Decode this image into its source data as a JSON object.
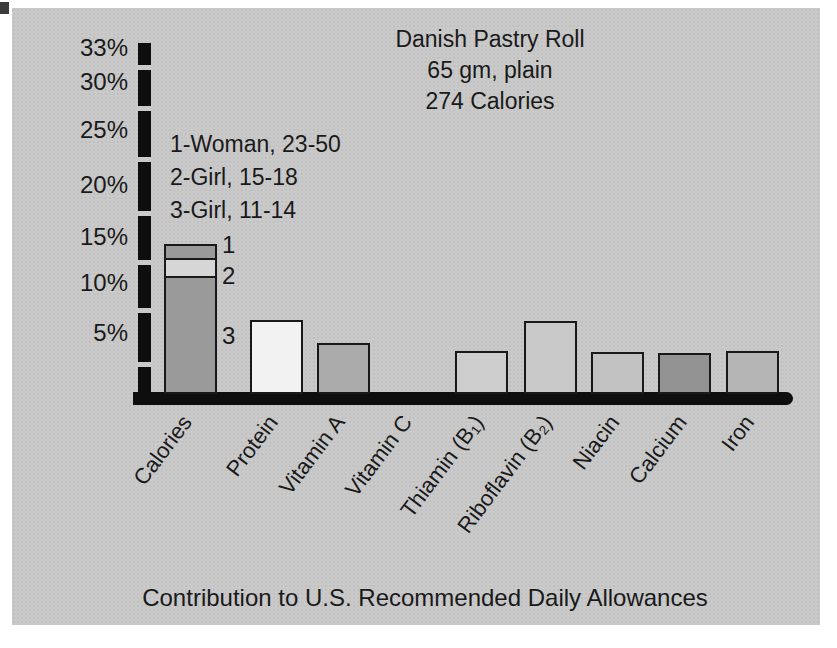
{
  "chart_data": {
    "type": "bar",
    "title_lines": [
      "Danish Pastry Roll",
      "65 gm, plain",
      "274 Calories"
    ],
    "legend": [
      "1-Woman, 23-50",
      "2-Girl, 15-18",
      "3-Girl, 11-14"
    ],
    "caption": "Contribution to U.S. Recommended Daily Allowances",
    "y_tick_labels": [
      "33%",
      "30%",
      "25%",
      "20%",
      "15%",
      "10%",
      "5%"
    ],
    "ylim": [
      0,
      33
    ],
    "grid": false,
    "legend_position": "upper-left",
    "categories": [
      "Calories",
      "Protein",
      "Vitamin A",
      "Vitamin C",
      "Thiamin (B₁)",
      "Riboflavin (B₂)",
      "Niacin",
      "Calcium",
      "Iron"
    ],
    "bars": [
      {
        "category": "Calories",
        "stacked_marks": [
          {
            "label": "1",
            "person": "Woman, 23-50",
            "value": 14.0,
            "color": "#9a9a9a"
          },
          {
            "label": "2",
            "person": "Girl, 15-18",
            "value": 12.7,
            "color": "#d6d6d6"
          },
          {
            "label": "3",
            "person": "Girl, 11-14",
            "value": 10.8,
            "color": "#989898"
          }
        ]
      },
      {
        "category": "Protein",
        "value": 6.8,
        "color": "#f2f2f2"
      },
      {
        "category": "Vitamin A",
        "value": 4.6,
        "color": "#ababab"
      },
      {
        "category": "Vitamin C",
        "value": 0,
        "color": null
      },
      {
        "category": "Thiamin (B₁)",
        "value": 3.9,
        "color": "#cdcdcd"
      },
      {
        "category": "Riboflavin (B₂)",
        "value": 6.7,
        "color": "#c8c8c8"
      },
      {
        "category": "Niacin",
        "value": 3.8,
        "color": "#c2c2c2"
      },
      {
        "category": "Calcium",
        "value": 3.7,
        "color": "#939393"
      },
      {
        "category": "Iron",
        "value": 3.9,
        "color": "#b5b5b5"
      }
    ],
    "axis_color": "#0e0e0e"
  }
}
